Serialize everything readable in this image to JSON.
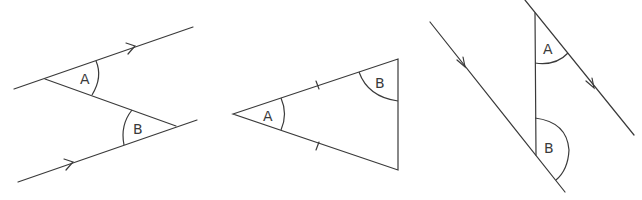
{
  "figures": [
    {
      "id": "parallel-lines-z",
      "description": "Two parallel lines cut by a transversal forming alternate angles",
      "labels": {
        "angle_a": "A",
        "angle_b": "B"
      }
    },
    {
      "id": "isosceles-triangle",
      "description": "Isosceles triangle with equal-side tick marks",
      "labels": {
        "angle_a": "A",
        "angle_b": "B"
      }
    },
    {
      "id": "parallel-lines-co-interior",
      "description": "Two parallel lines cut by a transversal forming angles A and B",
      "labels": {
        "angle_a": "A",
        "angle_b": "B"
      }
    }
  ],
  "colors": {
    "stroke": "#3a3a3a",
    "background": "#ffffff"
  }
}
